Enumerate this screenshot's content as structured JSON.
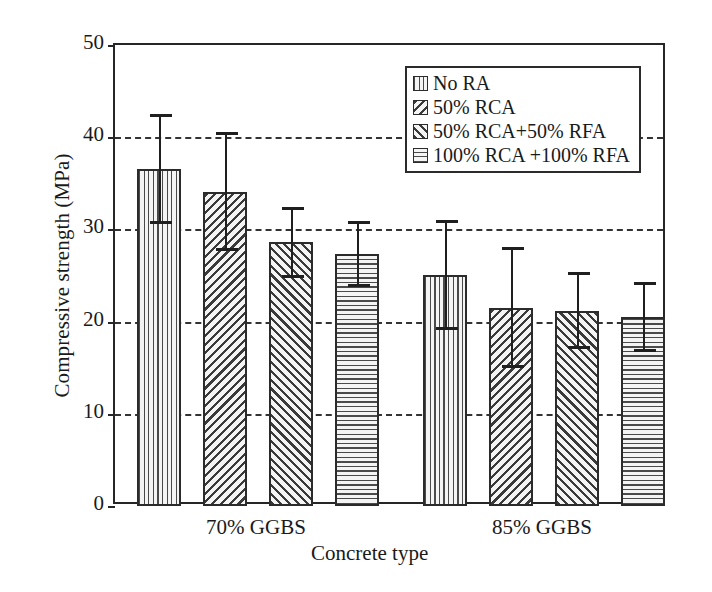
{
  "chart_data": {
    "type": "bar",
    "title": "",
    "xlabel": "Concrete type",
    "ylabel": "Compressive strength (MPa)",
    "ylim": [
      0,
      50
    ],
    "yticks": [
      0,
      10,
      20,
      30,
      40,
      50
    ],
    "ytick_labels": [
      "0",
      "10",
      "20",
      "30",
      "40",
      "50"
    ],
    "grid": "horizontal-dashed",
    "legend_position": "upper-right-inside",
    "categories": [
      "70% GGBS",
      "85% GGBS"
    ],
    "series": [
      {
        "name": "No RA",
        "pattern": "vertical",
        "values": [
          36.6,
          25.1
        ],
        "errors": [
          5.8,
          5.8
        ]
      },
      {
        "name": "50% RCA",
        "pattern": "diagonal-back",
        "values": [
          34.1,
          21.5
        ],
        "errors": [
          6.3,
          6.4
        ]
      },
      {
        "name": "50% RCA+50% RFA",
        "pattern": "diagonal-forward",
        "values": [
          28.6,
          21.2
        ],
        "errors": [
          3.7,
          4.0
        ]
      },
      {
        "name": "100% RCA +100% RFA",
        "pattern": "horizontal",
        "values": [
          27.3,
          20.5
        ],
        "errors": [
          3.4,
          3.6
        ]
      }
    ]
  },
  "legend": {
    "items": [
      {
        "label": "No RA",
        "pattern": "vertical"
      },
      {
        "label": "50% RCA",
        "pattern": "diagonal-back"
      },
      {
        "label": "50% RCA+50% RFA",
        "pattern": "diagonal-forward"
      },
      {
        "label": "100% RCA +100% RFA",
        "pattern": "horizontal"
      }
    ]
  },
  "axes": {
    "y_title": "Compressive strength (MPa)",
    "x_title": "Concrete type",
    "y_tick_labels": [
      "50",
      "40",
      "30",
      "20",
      "10",
      "0"
    ],
    "x_group_labels": [
      "70% GGBS",
      "85% GGBS"
    ]
  }
}
